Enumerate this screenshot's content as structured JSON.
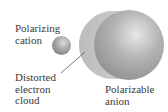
{
  "figure": {
    "labels": {
      "cation": [
        "Polarizing",
        "cation"
      ],
      "cloud": [
        "Distorted",
        "electron",
        "cloud"
      ],
      "anion": [
        "Polarizable",
        "anion"
      ]
    },
    "colors": {
      "background": "#ffffff",
      "sphere_dark": "#8a8a8a",
      "sphere_mid": "#b0b0b0",
      "sphere_highlight": "#e6e6e6",
      "cloud": "#c4c4c4",
      "leader_line": "#555555",
      "text": "#3a3a3a"
    }
  }
}
